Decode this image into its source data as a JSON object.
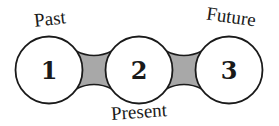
{
  "diagram": {
    "type": "timeline-linked-circles",
    "colors": {
      "circle_fill": "#ffffff",
      "stroke": "#1a1a1a",
      "connector_fill": "#a8a8a8"
    },
    "nodes": [
      {
        "number": "1",
        "label": "Past"
      },
      {
        "number": "2",
        "label": "Present"
      },
      {
        "number": "3",
        "label": "Future"
      }
    ]
  }
}
